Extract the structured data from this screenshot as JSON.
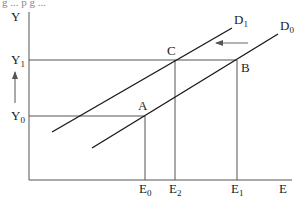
{
  "diagram": {
    "top_cropped_text": "g ... p  g ...",
    "axes": {
      "y_label": "Y",
      "x_label": "E"
    },
    "curves": [
      {
        "id": "D1",
        "label": "D",
        "subscript": "1"
      },
      {
        "id": "D0",
        "label": "D",
        "subscript": "0"
      }
    ],
    "points": [
      {
        "id": "A",
        "label": "A"
      },
      {
        "id": "B",
        "label": "B"
      },
      {
        "id": "C",
        "label": "C"
      }
    ],
    "y_ticks": [
      {
        "label": "Y",
        "subscript": "1"
      },
      {
        "label": "Y",
        "subscript": "0"
      }
    ],
    "x_ticks": [
      {
        "label": "E",
        "subscript": "0"
      },
      {
        "label": "E",
        "subscript": "2"
      },
      {
        "label": "E",
        "subscript": "1"
      }
    ],
    "annotations": {
      "shift_arrow": "left (D0 to D1)",
      "y_arrow": "up (Y0 to Y1)"
    },
    "colors": {
      "curve": "#1a1a1a",
      "guide": "#555555",
      "axis": "#555555",
      "arrow": "#666666"
    }
  }
}
